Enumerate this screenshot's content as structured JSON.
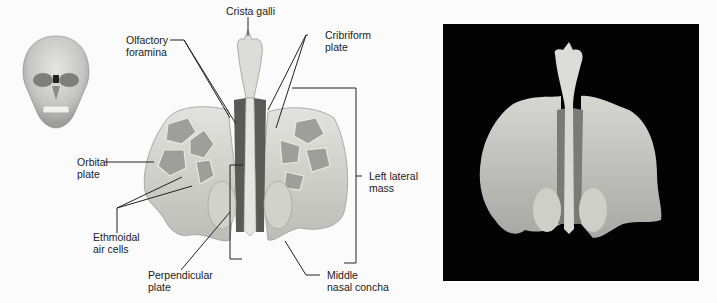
{
  "figure": {
    "thumbnail": "skull-anterior-view",
    "labels": {
      "crista_galli": [
        "Crista galli"
      ],
      "olfactory_foramina": [
        "Olfactory",
        "foramina"
      ],
      "cribriform_plate": [
        "Cribriform",
        "plate"
      ],
      "orbital_plate": [
        "Orbital",
        "plate"
      ],
      "ethmoidal_air_cells": [
        "Ethmoidal",
        "air cells"
      ],
      "left_lateral_mass": [
        "Left lateral",
        "mass"
      ],
      "perpendicular_plate": [
        "Perpendicular",
        "plate"
      ],
      "middle_nasal_concha": [
        "Middle",
        "nasal concha"
      ]
    },
    "colors": {
      "background": "#fbfbfb",
      "bone": "#d9d9d5",
      "bone_shadow": "#8f8f8b",
      "leader_line": "#222222",
      "photo_background": "#030303"
    }
  }
}
